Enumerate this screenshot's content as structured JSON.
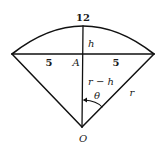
{
  "diagram": {
    "type": "geometry",
    "labels": {
      "arc_length": "12",
      "height": "h",
      "half_chord_left": "5",
      "half_chord_right": "5",
      "midpoint": "A",
      "distance_center_to_chord": "r − h",
      "angle": "θ",
      "radius": "r",
      "center": "O"
    },
    "points": {
      "O": [
        82,
        127
      ],
      "A": [
        83,
        54
      ],
      "left_vertex": [
        12,
        54
      ],
      "right_vertex": [
        154,
        54
      ],
      "arc_top": [
        83,
        26
      ]
    },
    "colors": {
      "line": "#111111",
      "text": "#1a1a1a",
      "background": "#ffffff"
    }
  }
}
